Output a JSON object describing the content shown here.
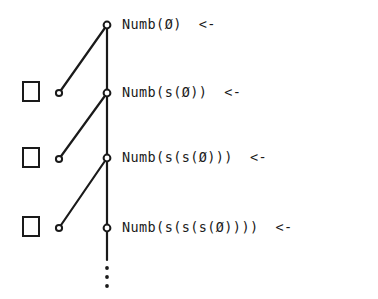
{
  "figure": {
    "background_color": "#ffffff",
    "ink_color": "#1a1a1a"
  },
  "spine": {
    "x": 107,
    "y_top": 25,
    "y_bottom": 260,
    "stroke_width": 2.2,
    "ellipsis_dots_y": [
      268,
      277,
      286
    ],
    "ellipsis_dot_radius": 1.9
  },
  "nodes": [
    {
      "id": "node-0",
      "cx": 107,
      "cy": 25,
      "r": 3.4,
      "filled": false
    },
    {
      "id": "node-1",
      "cx": 107,
      "cy": 93,
      "r": 3.4,
      "filled": false
    },
    {
      "id": "node-2",
      "cx": 107,
      "cy": 158,
      "r": 3.4,
      "filled": false
    },
    {
      "id": "node-3",
      "cx": 107,
      "cy": 228,
      "r": 3.4,
      "filled": false
    }
  ],
  "branches": [
    {
      "id": "branch-1",
      "square": {
        "x": 23,
        "y": 82,
        "width": 16,
        "height": 19
      },
      "leaf_circle": {
        "cx": 59,
        "cy": 93,
        "r": 3.1
      },
      "edge": {
        "x1": 59,
        "y1": 93,
        "x2": 107,
        "y2": 25
      }
    },
    {
      "id": "branch-2",
      "square": {
        "x": 23,
        "y": 148,
        "width": 16,
        "height": 19
      },
      "leaf_circle": {
        "cx": 59,
        "cy": 159,
        "r": 3.1
      },
      "edge": {
        "x1": 59,
        "y1": 159,
        "x2": 107,
        "y2": 93
      }
    },
    {
      "id": "branch-3",
      "square": {
        "x": 23,
        "y": 217,
        "width": 16,
        "height": 19
      },
      "leaf_circle": {
        "cx": 59,
        "cy": 228,
        "r": 3.1
      },
      "edge": {
        "x1": 59,
        "y1": 228,
        "x2": 107,
        "y2": 158
      }
    }
  ],
  "labels": [
    {
      "id": "label-0",
      "goal": "Numb(Ø)",
      "arrow": "<-",
      "text": "Numb(Ø)  <-",
      "x": 122,
      "y": 18
    },
    {
      "id": "label-1",
      "goal": "Numb(s(Ø))",
      "arrow": "<-",
      "text": "Numb(s(Ø))  <-",
      "x": 122,
      "y": 86
    },
    {
      "id": "label-2",
      "goal": "Numb(s(s(Ø)))",
      "arrow": "<-",
      "text": "Numb(s(s(Ø)))  <-",
      "x": 122,
      "y": 151
    },
    {
      "id": "label-3",
      "goal": "Numb(s(s(s(Ø))))",
      "arrow": "<-",
      "text": "Numb(s(s(s(Ø))))  <-",
      "x": 122,
      "y": 221
    }
  ]
}
